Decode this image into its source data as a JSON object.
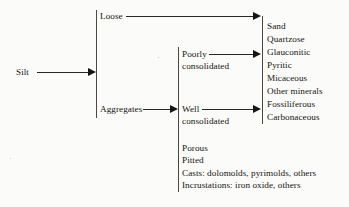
{
  "diagram": {
    "type": "tree",
    "root": {
      "label": "Silt"
    },
    "level1": [
      {
        "label": "Loose"
      },
      {
        "label": "Aggregates"
      }
    ],
    "level2": [
      {
        "label": "Poorly",
        "label_line2": "consolidated"
      },
      {
        "label": "Well",
        "label_line2": "consolidated"
      }
    ],
    "level3": [
      {
        "label": "Sand"
      },
      {
        "label": "Quartzose"
      },
      {
        "label": "Glauconitic"
      },
      {
        "label": "Pyritic"
      },
      {
        "label": "Micaceous"
      },
      {
        "label": "Other minerals"
      },
      {
        "label": "Fossiliferous"
      },
      {
        "label": "Carbonaceous"
      }
    ],
    "notes": [
      {
        "label": "Porous"
      },
      {
        "label": "Pitted"
      },
      {
        "label": "Casts:  dolomolds, pyrimolds, others"
      },
      {
        "label": "Incrustations:  iron oxide, others"
      }
    ],
    "colors": {
      "background": "#fbfbfa",
      "text": "#17150f",
      "line": "#2a2824",
      "bar": "#4a4742"
    }
  }
}
